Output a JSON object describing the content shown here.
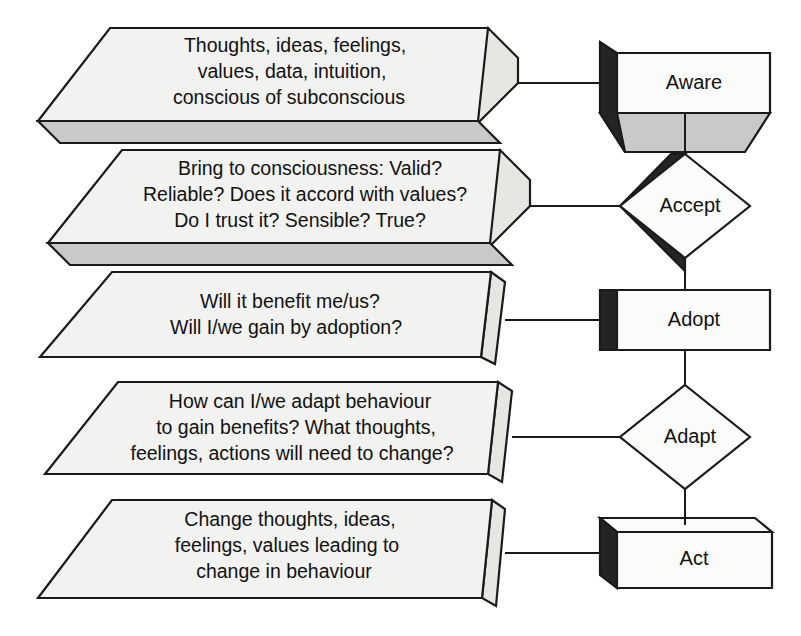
{
  "diagram": {
    "colors": {
      "face_front": "#f2f2f0",
      "face_white": "#fbfbfa",
      "face_gray": "#c9c9c7",
      "face_dark": "#242424",
      "face_side": "#e6e6e3",
      "outline": "#1a1a1a",
      "background": "#ffffff",
      "text": "#111111"
    },
    "stages": [
      {
        "id": "aware",
        "node_label": "Aware",
        "node_shape": "cube-3d",
        "description_shape": "parallelogram-3d",
        "description_lines": [
          "Thoughts, ideas, feelings,",
          "values, data, intuition,",
          "conscious of subconscious"
        ]
      },
      {
        "id": "accept",
        "node_label": "Accept",
        "node_shape": "diamond-3d",
        "description_shape": "parallelogram-3d",
        "description_lines": [
          "Bring to consciousness: Valid?",
          "Reliable? Does it accord with values?",
          "Do I trust it? Sensible? True?"
        ]
      },
      {
        "id": "adopt",
        "node_label": "Adopt",
        "node_shape": "cube-3d",
        "description_shape": "parallelogram-flat",
        "description_lines": [
          "Will it benefit me/us?",
          "Will I/we gain by adoption?"
        ]
      },
      {
        "id": "adapt",
        "node_label": "Adapt",
        "node_shape": "diamond",
        "description_shape": "parallelogram-flat",
        "description_lines": [
          "How can I/we adapt behaviour",
          "to gain benefits? What thoughts,",
          "feelings, actions will need to change?"
        ]
      },
      {
        "id": "act",
        "node_label": "Act",
        "node_shape": "cube-3d",
        "description_shape": "parallelogram-flat",
        "description_lines": [
          "Change thoughts, ideas,",
          "feelings, values leading to",
          "change in behaviour"
        ]
      }
    ],
    "connectors": [
      {
        "from": "aware-description",
        "to": "aware-node"
      },
      {
        "from": "accept-description",
        "to": "accept-node"
      },
      {
        "from": "adopt-description",
        "to": "adopt-node"
      },
      {
        "from": "adapt-description",
        "to": "adapt-node"
      },
      {
        "from": "act-description",
        "to": "act-node"
      },
      {
        "from": "aware-node",
        "to": "accept-node"
      },
      {
        "from": "accept-node",
        "to": "adopt-node"
      },
      {
        "from": "adopt-node",
        "to": "adapt-node"
      },
      {
        "from": "adapt-node",
        "to": "act-node"
      }
    ]
  }
}
